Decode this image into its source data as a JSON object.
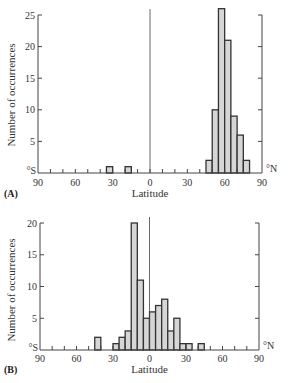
{
  "chart_data": [
    {
      "type": "bar",
      "panel": "(A)",
      "title": "",
      "xlabel": "Latitude",
      "ylabel": "Number of occurrences",
      "xlim": [
        -90,
        90
      ],
      "ylim": [
        0,
        26
      ],
      "x_tick_labels": [
        "90",
        "60",
        "30",
        "0",
        "30",
        "60",
        "90"
      ],
      "x_ticks": [
        -90,
        -60,
        -30,
        0,
        30,
        60,
        90
      ],
      "y_tick_labels": [
        "25",
        "20",
        "15",
        "10",
        "5"
      ],
      "y_ticks": [
        25,
        20,
        15,
        10,
        5
      ],
      "south_label": "°S",
      "north_label": "°N",
      "bin_width": 5,
      "bins": [
        {
          "from": -35,
          "to": -30,
          "count": 1
        },
        {
          "from": -20,
          "to": -15,
          "count": 1
        },
        {
          "from": 45,
          "to": 50,
          "count": 2
        },
        {
          "from": 50,
          "to": 55,
          "count": 10
        },
        {
          "from": 55,
          "to": 60,
          "count": 26
        },
        {
          "from": 60,
          "to": 65,
          "count": 21
        },
        {
          "from": 65,
          "to": 70,
          "count": 9
        },
        {
          "from": 70,
          "to": 75,
          "count": 6
        },
        {
          "from": 75,
          "to": 80,
          "count": 2
        }
      ],
      "grid": false,
      "equator_line": true
    },
    {
      "type": "bar",
      "panel": "(B)",
      "title": "",
      "xlabel": "Latitude",
      "ylabel": "Number of occurrences",
      "xlim": [
        -90,
        90
      ],
      "ylim": [
        0,
        20
      ],
      "x_tick_labels": [
        "90",
        "60",
        "30",
        "0",
        "30",
        "60",
        "90"
      ],
      "x_ticks": [
        -90,
        -60,
        -30,
        0,
        30,
        60,
        90
      ],
      "y_tick_labels": [
        "20",
        "15",
        "10",
        "5"
      ],
      "y_ticks": [
        20,
        15,
        10,
        5
      ],
      "south_label": "°S",
      "north_label": "°N",
      "bin_width": 5,
      "bins": [
        {
          "from": -45,
          "to": -40,
          "count": 2
        },
        {
          "from": -30,
          "to": -25,
          "count": 1
        },
        {
          "from": -25,
          "to": -20,
          "count": 2
        },
        {
          "from": -20,
          "to": -15,
          "count": 3
        },
        {
          "from": -15,
          "to": -10,
          "count": 20
        },
        {
          "from": -10,
          "to": -5,
          "count": 11
        },
        {
          "from": -5,
          "to": 0,
          "count": 5
        },
        {
          "from": 0,
          "to": 5,
          "count": 6
        },
        {
          "from": 5,
          "to": 10,
          "count": 7
        },
        {
          "from": 10,
          "to": 15,
          "count": 8
        },
        {
          "from": 15,
          "to": 20,
          "count": 3
        },
        {
          "from": 20,
          "to": 25,
          "count": 5
        },
        {
          "from": 25,
          "to": 30,
          "count": 1
        },
        {
          "from": 30,
          "to": 35,
          "count": 1
        },
        {
          "from": 40,
          "to": 45,
          "count": 1
        }
      ],
      "grid": false,
      "equator_line": true
    }
  ],
  "colors": {
    "bar_fill": "#d6d6d6",
    "bar_stroke": "#333333",
    "axis": "#444444"
  }
}
